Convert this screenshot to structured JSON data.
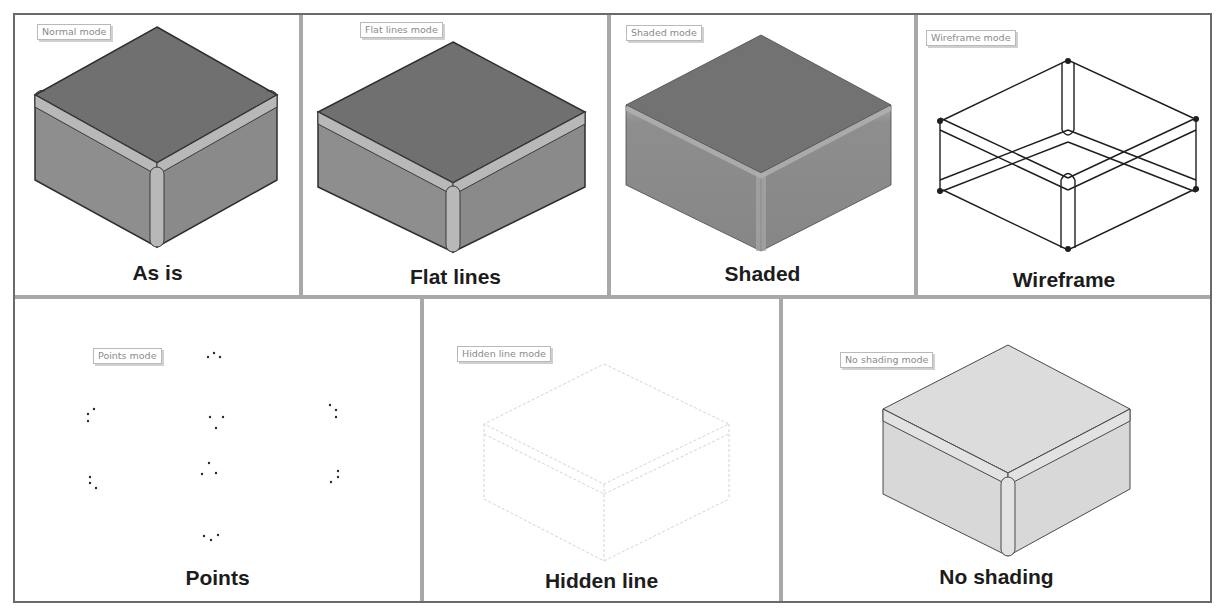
{
  "figure": {
    "top_row": [
      {
        "id": "as-is",
        "tag": "Normal mode",
        "caption": "As is",
        "render": "shaded-with-edges"
      },
      {
        "id": "flat-lines",
        "tag": "Flat lines mode",
        "caption": "Flat lines",
        "render": "flat-with-edges"
      },
      {
        "id": "shaded",
        "tag": "Shaded mode",
        "caption": "Shaded",
        "render": "shaded"
      },
      {
        "id": "wireframe",
        "tag": "Wireframe mode",
        "caption": "Wireframe",
        "render": "wireframe"
      }
    ],
    "bottom_row": [
      {
        "id": "points",
        "tag": "Points mode",
        "caption": "Points",
        "render": "points"
      },
      {
        "id": "hidden-line",
        "tag": "Hidden line mode",
        "caption": "Hidden line",
        "render": "hidden-line"
      },
      {
        "id": "no-shading",
        "tag": "No shading mode",
        "caption": "No shading",
        "render": "no-shading"
      }
    ]
  },
  "colors": {
    "frame": "#6a6a6a",
    "divider": "#a8a8a8",
    "top_face": "#6f6f6f",
    "side_face": "#8a8a8a",
    "fillet": "#b4b4b4",
    "edge": "#2e2e2e",
    "no_shading_face": "#dcdcdc",
    "hidden_line": "#d6d6d6",
    "caption": "#1c1c1c"
  }
}
